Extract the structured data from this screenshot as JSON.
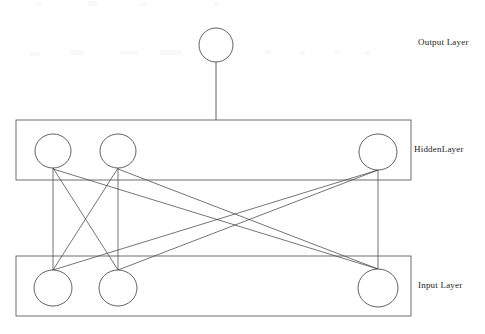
{
  "diagram": {
    "type": "feedforward-neural-network",
    "topology": "3-3-1",
    "background_color": "#ffffff",
    "stroke_color": "#3a3a3a",
    "node_fill": "#ffffff",
    "labels": {
      "output_layer": "Output Layer",
      "hidden_layer": "HiddenLayer",
      "input_layer": "Input Layer"
    },
    "layers": [
      {
        "id": "output",
        "name": "Output Layer",
        "label": "Output Layer",
        "node_count": 1,
        "boxed": false,
        "nodes": [
          {
            "id": "o1",
            "cx": 216,
            "cy": 45,
            "r": 17
          }
        ]
      },
      {
        "id": "hidden",
        "name": "HiddenLayer",
        "label": "HiddenLayer",
        "node_count": 3,
        "boxed": true,
        "box": {
          "x": 16,
          "y": 120,
          "width": 395,
          "height": 60
        },
        "nodes": [
          {
            "id": "h1",
            "cx": 53,
            "cy": 151,
            "rx": 18,
            "ry": 17
          },
          {
            "id": "h2",
            "cx": 118,
            "cy": 151,
            "rx": 18,
            "ry": 17
          },
          {
            "id": "h3",
            "cx": 378,
            "cy": 152,
            "rx": 19,
            "ry": 18
          }
        ]
      },
      {
        "id": "input",
        "name": "Input Layer",
        "label": "Input Layer",
        "node_count": 3,
        "boxed": true,
        "box": {
          "x": 16,
          "y": 256,
          "width": 395,
          "height": 60
        },
        "nodes": [
          {
            "id": "i1",
            "cx": 53,
            "cy": 288,
            "rx": 19,
            "ry": 18
          },
          {
            "id": "i2",
            "cx": 118,
            "cy": 288,
            "rx": 19,
            "ry": 18
          },
          {
            "id": "i3",
            "cx": 378,
            "cy": 288,
            "rx": 20,
            "ry": 19
          }
        ]
      }
    ],
    "connections": {
      "input_to_hidden": [
        {
          "from": "i1",
          "to": "h1"
        },
        {
          "from": "i1",
          "to": "h2"
        },
        {
          "from": "i1",
          "to": "h3"
        },
        {
          "from": "i2",
          "to": "h1"
        },
        {
          "from": "i2",
          "to": "h2"
        },
        {
          "from": "i2",
          "to": "h3"
        },
        {
          "from": "i3",
          "to": "h1"
        },
        {
          "from": "i3",
          "to": "h2"
        },
        {
          "from": "i3",
          "to": "h3"
        }
      ],
      "hidden_to_output": [
        {
          "from": "h2",
          "to": "o1"
        }
      ]
    }
  }
}
